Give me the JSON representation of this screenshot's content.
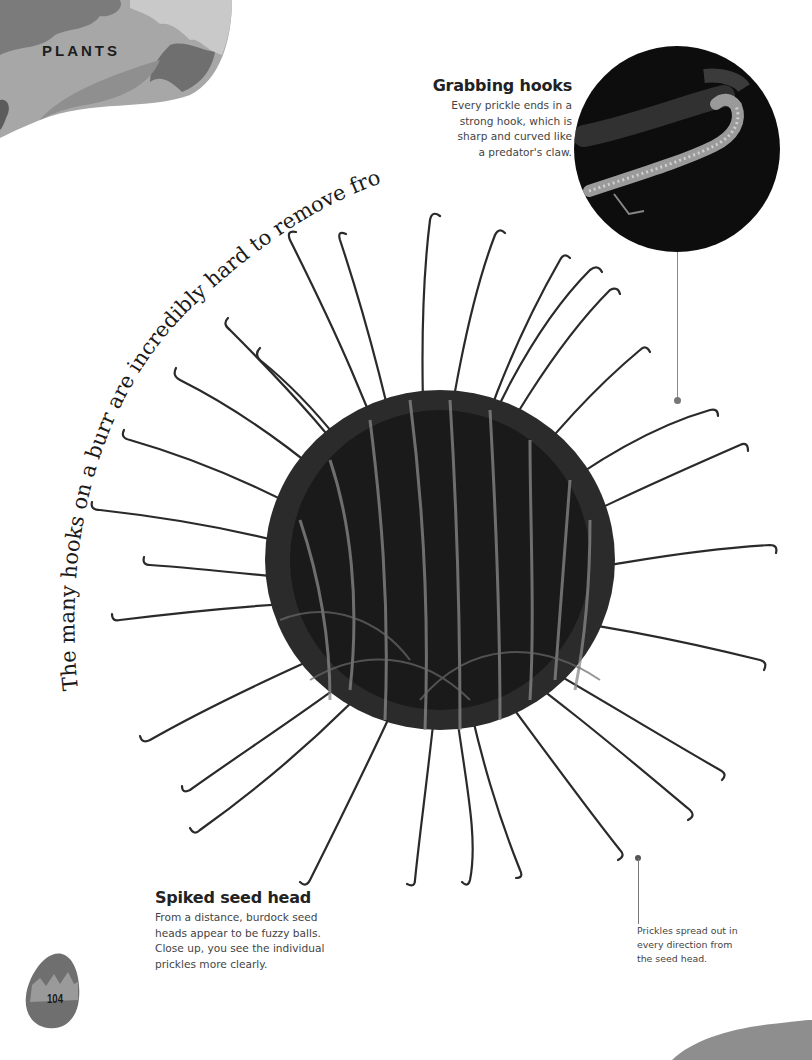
{
  "header": {
    "section_label": "PLANTS"
  },
  "arc_caption": {
    "text": "The many hooks on a burr are incredibly hard to remove from thick fur."
  },
  "callouts": {
    "grabbing_hooks": {
      "title": "Grabbing hooks",
      "body_lines": [
        "Every prickle ends in a",
        "strong hook, which is",
        "sharp and curved like",
        "a predator's claw."
      ]
    },
    "spiked_seed_head": {
      "title": "Spiked seed head",
      "body_lines": [
        "From a distance, burdock seed",
        "heads appear to be fuzzy balls.",
        "Close up, you see the individual",
        "prickles more clearly."
      ]
    },
    "prickles_spread": {
      "body_lines": [
        "Prickles spread out in",
        "every direction from",
        "the seed head."
      ]
    }
  },
  "images": {
    "main_photo": "burdock-burr-seed-head",
    "zoom_inset": "hook-tip-closeup"
  },
  "footer": {
    "page_number": "104"
  },
  "colors": {
    "page_background": "#ffffff",
    "corner_blob_light": "#b5b5b5",
    "corner_blob_mid": "#8f8f8f",
    "corner_blob_dark": "#6e6e6e",
    "burr_dark": "#1a1a1a",
    "inset_background": "#0d0d0d",
    "inset_ring": "#8a8a8a",
    "text_heading": "#222222",
    "text_body": "#444444"
  }
}
